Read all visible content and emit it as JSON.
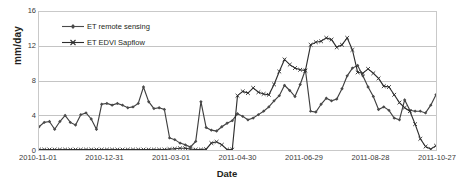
{
  "chart_data": {
    "type": "line",
    "title": "",
    "xlabel": "Date",
    "ylabel": "mm/day",
    "ylim": [
      0,
      16
    ],
    "yticks": [
      0,
      4,
      8,
      12,
      16
    ],
    "xticks": [
      "2010-11-01",
      "2010-12-31",
      "2011-03-01",
      "2011-04-30",
      "2011-06-29",
      "2011-08-28",
      "2011-10-27"
    ],
    "xlim": [
      "2010-11-01",
      "2011-11-04"
    ],
    "grid": "horizontal",
    "legend_position": "upper-left-inside",
    "series": [
      {
        "name": "ET remote sensing",
        "marker": "diamond",
        "color": "#4a4a4a",
        "values": [
          2.7,
          3.2,
          3.3,
          2.4,
          3.3,
          4.0,
          3.2,
          2.9,
          4.1,
          4.3,
          3.6,
          2.4,
          5.3,
          5.4,
          5.2,
          5.4,
          5.2,
          4.9,
          5.0,
          5.4,
          7.3,
          5.6,
          4.8,
          4.9,
          4.7,
          1.4,
          1.2,
          0.8,
          0.6,
          0.35,
          1.0,
          5.6,
          2.6,
          2.3,
          2.2,
          2.7,
          3.1,
          3.4,
          4.2,
          3.9,
          3.5,
          3.7,
          4.1,
          4.5,
          5.0,
          5.7,
          6.3,
          7.5,
          6.9,
          6.2,
          7.6,
          9.3,
          4.5,
          4.4,
          5.3,
          6.0,
          5.7,
          5.9,
          7.1,
          8.6,
          9.5,
          9.8,
          8.6,
          7.3,
          6.2,
          4.7,
          5.0,
          4.6,
          3.7,
          3.5,
          5.8,
          4.6,
          4.5,
          4.5,
          4.3,
          5.2,
          6.4
        ]
      },
      {
        "name": "ET EDVI Sapflow",
        "marker": "x",
        "color": "#2e2e2e",
        "values": [
          0.05,
          0.05,
          0.05,
          0.05,
          0.05,
          0.05,
          0.05,
          0.05,
          0.05,
          0.05,
          0.05,
          0.05,
          0.05,
          0.05,
          0.05,
          0.05,
          0.05,
          0.05,
          0.05,
          0.05,
          0.05,
          0.05,
          0.05,
          0.05,
          0.05,
          0.1,
          0.15,
          0.2,
          0.2,
          0.1,
          0.05,
          0.05,
          0.1,
          0.8,
          0.95,
          0.6,
          0.05,
          0.05,
          6.3,
          6.8,
          6.6,
          7.2,
          6.7,
          6.5,
          6.4,
          7.6,
          9.1,
          10.5,
          9.9,
          9.5,
          9.3,
          9.2,
          12.2,
          12.5,
          12.6,
          13.0,
          12.8,
          11.9,
          12.2,
          13.0,
          11.6,
          9.0,
          8.9,
          9.4,
          8.9,
          8.3,
          7.4,
          7.3,
          6.4,
          5.5,
          4.9,
          4.5,
          3.0,
          1.3,
          0.4,
          0.1,
          0.5
        ]
      }
    ]
  }
}
